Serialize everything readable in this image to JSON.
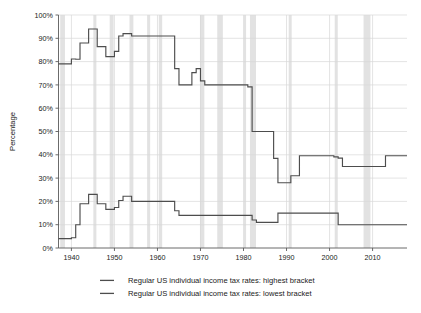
{
  "chart_data": {
    "type": "line",
    "title": "",
    "xlabel": "",
    "ylabel": "Percentage",
    "xlim": [
      1937,
      2018
    ],
    "ylim": [
      0,
      100
    ],
    "grid": true,
    "legend_position": "bottom",
    "y_tick_labels": [
      "0%",
      "10%",
      "20%",
      "30%",
      "40%",
      "50%",
      "60%",
      "70%",
      "80%",
      "90%",
      "100%"
    ],
    "y_tick_values": [
      0,
      10,
      20,
      30,
      40,
      50,
      60,
      70,
      80,
      90,
      100
    ],
    "x_tick_labels": [
      "1940",
      "1950",
      "1960",
      "1970",
      "1980",
      "1990",
      "2000",
      "2010"
    ],
    "x_tick_values": [
      1940,
      1950,
      1960,
      1970,
      1980,
      1990,
      2000,
      2010
    ],
    "step_style": "post",
    "series": [
      {
        "name": "Regular US individual income tax rates: highest bracket",
        "color": "#4d4d4d",
        "x": [
          1937,
          1938,
          1939,
          1940,
          1941,
          1942,
          1944,
          1946,
          1948,
          1950,
          1951,
          1952,
          1954,
          1964,
          1965,
          1968,
          1969,
          1970,
          1971,
          1981,
          1982,
          1987,
          1988,
          1991,
          1993,
          2001,
          2002,
          2003,
          2013,
          2018
        ],
        "values": [
          79,
          79,
          79,
          81.1,
          81,
          88,
          94,
          86.45,
          82.13,
          84.36,
          91,
          92,
          91,
          77,
          70,
          75.25,
          77,
          71.75,
          70,
          69.125,
          50,
          38.5,
          28,
          31,
          39.6,
          39.1,
          38.6,
          35,
          39.6,
          39.6
        ]
      },
      {
        "name": "Regular US individual income tax rates: lowest bracket",
        "color": "#4d4d4d",
        "x": [
          1937,
          1940,
          1941,
          1942,
          1944,
          1946,
          1948,
          1950,
          1951,
          1952,
          1954,
          1964,
          1965,
          1968,
          1969,
          1970,
          1971,
          1979,
          1982,
          1983,
          1987,
          1988,
          2001,
          2002,
          2018
        ],
        "values": [
          4,
          4.4,
          10,
          19,
          23,
          19,
          16.6,
          17.4,
          20.4,
          22.2,
          20,
          16,
          14,
          14,
          14,
          14,
          14,
          14,
          12,
          11,
          11,
          15,
          15,
          10,
          10
        ]
      }
    ],
    "recession_bands": [
      [
        1937.4,
        1938.5
      ],
      [
        1945.1,
        1945.8
      ],
      [
        1948.9,
        1949.8
      ],
      [
        1953.5,
        1954.4
      ],
      [
        1957.6,
        1958.3
      ],
      [
        1960.3,
        1961.1
      ],
      [
        1969.9,
        1970.9
      ],
      [
        1973.9,
        1975.2
      ],
      [
        1980.1,
        1980.6
      ],
      [
        1981.5,
        1982.9
      ],
      [
        1990.5,
        1991.2
      ],
      [
        2001.2,
        2001.9
      ],
      [
        2007.9,
        2009.5
      ]
    ]
  },
  "legend": {
    "items": [
      {
        "label": "Regular US individual income tax rates: highest bracket"
      },
      {
        "label": "Regular US individual income tax rates: lowest bracket"
      }
    ]
  }
}
